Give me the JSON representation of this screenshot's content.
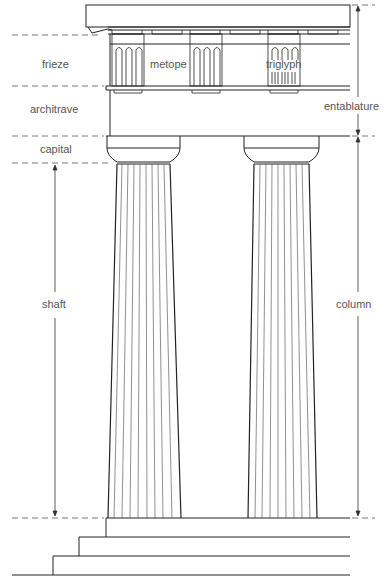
{
  "diagram": {
    "labels": {
      "frieze": "frieze",
      "metope": "metope",
      "triglyph": "triglyph",
      "architrave": "architrave",
      "entablature": "entablature",
      "capital": "capital",
      "shaft": "shaft",
      "column": "column"
    },
    "colors": {
      "line": "#222222",
      "dash": "#555555",
      "text": "#555555"
    }
  }
}
